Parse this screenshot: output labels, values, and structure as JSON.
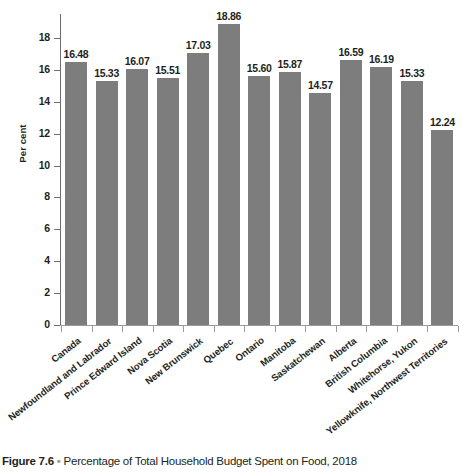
{
  "chart_data": {
    "type": "bar",
    "title": "Percentage of Total Household Budget Spent on Food, 2018",
    "figure_number": "Figure 7.6",
    "bullet": "•",
    "xlabel": "",
    "ylabel": "Per cent",
    "ylim": [
      0,
      19.5
    ],
    "yticks": [
      0,
      2,
      4,
      6,
      8,
      10,
      12,
      14,
      16,
      18
    ],
    "ytick_labels": [
      "0",
      "2",
      "4",
      "6",
      "8",
      "10",
      "12",
      "14",
      "16",
      "18"
    ],
    "grid": false,
    "legend": false,
    "bar_color": "#7d7d7d",
    "categories": [
      "Canada",
      "Newfoundland and Labrador",
      "Prince Edward Island",
      "Nova Scotia",
      "New Brunswick",
      "Quebec",
      "Ontario",
      "Manitoba",
      "Saskatchewan",
      "Alberta",
      "British Columbia",
      "Whitehorse, Yukon",
      "Yellowknife, Northwest Territories"
    ],
    "values": [
      16.48,
      15.33,
      16.07,
      15.51,
      17.03,
      18.86,
      15.6,
      15.87,
      14.57,
      16.59,
      16.19,
      15.33,
      12.24
    ],
    "value_labels": [
      "16.48",
      "15.33",
      "16.07",
      "15.51",
      "17.03",
      "18.86",
      "15.60",
      "15.87",
      "14.57",
      "16.59",
      "16.19",
      "15.33",
      "12.24"
    ]
  }
}
